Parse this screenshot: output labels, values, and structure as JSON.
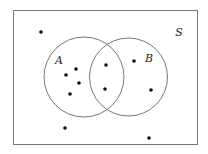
{
  "diagram": {
    "type": "venn",
    "universe": {
      "label": "S",
      "x": 13,
      "y": 10,
      "width": 184,
      "height": 134,
      "label_pos": [
        179,
        36
      ]
    },
    "sets": [
      {
        "label": "A",
        "cx": 84,
        "cy": 77,
        "r": 40,
        "label_pos": [
          59,
          64
        ]
      },
      {
        "label": "B",
        "cx": 128.5,
        "cy": 77,
        "r": 39,
        "label_pos": [
          149,
          62
        ]
      }
    ],
    "points": [
      {
        "region": "outside",
        "x": 41,
        "y": 32
      },
      {
        "region": "outside",
        "x": 65,
        "y": 128
      },
      {
        "region": "outside",
        "x": 149,
        "y": 138
      },
      {
        "region": "A_only",
        "x": 76,
        "y": 69
      },
      {
        "region": "A_only",
        "x": 66,
        "y": 75
      },
      {
        "region": "A_only",
        "x": 79,
        "y": 83
      },
      {
        "region": "A_only",
        "x": 70,
        "y": 94
      },
      {
        "region": "A_and_B",
        "x": 106,
        "y": 65
      },
      {
        "region": "A_and_B",
        "x": 105,
        "y": 89
      },
      {
        "region": "B_only",
        "x": 134,
        "y": 61
      },
      {
        "region": "B_only",
        "x": 151,
        "y": 90
      }
    ],
    "counts": {
      "outside": 3,
      "A_only": 4,
      "A_and_B": 2,
      "B_only": 2
    },
    "colors": {
      "line": "#777777",
      "point": "#111111",
      "label": "#222222"
    }
  }
}
